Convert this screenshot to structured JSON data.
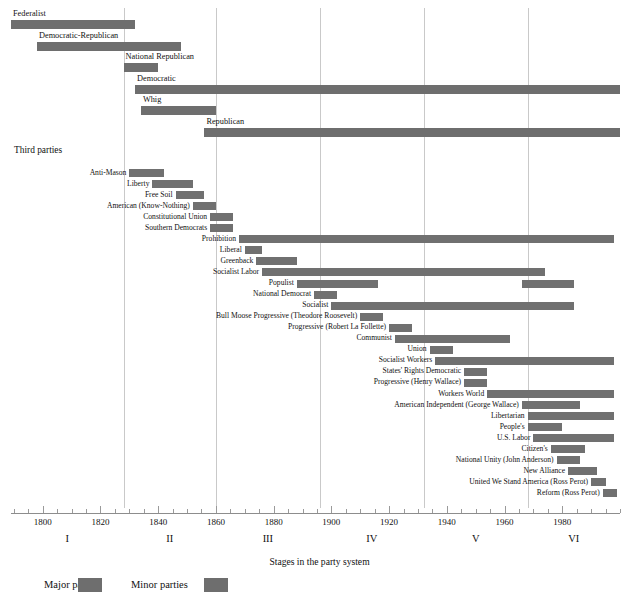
{
  "chart_data": {
    "type": "bar",
    "title": "",
    "subtitle": "",
    "xlabel": "Stages in the party system",
    "ylabel": "",
    "xlim": [
      1789,
      2000
    ],
    "grid": true,
    "legend_position": "bottom-left",
    "orientation": "horizontal-timeline",
    "tick_labels": [
      "1800",
      "1820",
      "1840",
      "1860",
      "1880",
      "1900",
      "1920",
      "1940",
      "1960",
      "1980"
    ],
    "tick_values": [
      1800,
      1820,
      1840,
      1860,
      1880,
      1900,
      1920,
      1940,
      1960,
      1980
    ],
    "minor_tick_step": 5,
    "stage_boundaries": [
      1828,
      1860,
      1896,
      1932,
      1968
    ],
    "stages": [
      {
        "label": "I",
        "start": 1789,
        "end": 1828
      },
      {
        "label": "II",
        "start": 1828,
        "end": 1860
      },
      {
        "label": "III",
        "start": 1860,
        "end": 1896
      },
      {
        "label": "IV",
        "start": 1896,
        "end": 1932
      },
      {
        "label": "V",
        "start": 1932,
        "end": 1968
      },
      {
        "label": "VI",
        "start": 1968,
        "end": 2000
      }
    ],
    "section_heading": "Third parties",
    "major_parties": [
      {
        "name": "Federalist",
        "spans": [
          [
            1789,
            1832
          ]
        ]
      },
      {
        "name": "Democratic-Republican",
        "spans": [
          [
            1798,
            1848
          ]
        ]
      },
      {
        "name": "National Republican",
        "spans": [
          [
            1828,
            1840
          ]
        ]
      },
      {
        "name": "Democratic",
        "spans": [
          [
            1832,
            2000
          ]
        ]
      },
      {
        "name": "Whig",
        "spans": [
          [
            1834,
            1860
          ]
        ]
      },
      {
        "name": "Republican",
        "spans": [
          [
            1856,
            2000
          ]
        ]
      }
    ],
    "minor_parties": [
      {
        "name": "Anti-Mason",
        "spans": [
          [
            1830,
            1842
          ]
        ]
      },
      {
        "name": "Liberty",
        "spans": [
          [
            1838,
            1852
          ]
        ]
      },
      {
        "name": "Free Soil",
        "spans": [
          [
            1846,
            1856
          ]
        ]
      },
      {
        "name": "American (Know-Nothing)",
        "spans": [
          [
            1852,
            1860
          ]
        ]
      },
      {
        "name": "Constitutional Union",
        "spans": [
          [
            1858,
            1866
          ]
        ]
      },
      {
        "name": "Southern Democrats",
        "spans": [
          [
            1858,
            1866
          ]
        ]
      },
      {
        "name": "Prohibition",
        "spans": [
          [
            1868,
            1998
          ]
        ]
      },
      {
        "name": "Liberal",
        "spans": [
          [
            1870,
            1876
          ]
        ]
      },
      {
        "name": "Greenback",
        "spans": [
          [
            1874,
            1888
          ]
        ]
      },
      {
        "name": "Socialist Labor",
        "spans": [
          [
            1876,
            1974
          ]
        ]
      },
      {
        "name": "Populist",
        "spans": [
          [
            1888,
            1916
          ],
          [
            1966,
            1984
          ]
        ]
      },
      {
        "name": "National Democrat",
        "spans": [
          [
            1894,
            1902
          ]
        ]
      },
      {
        "name": "Socialist",
        "spans": [
          [
            1900,
            1982
          ],
          [
            1962,
            1984
          ]
        ]
      },
      {
        "name": "Bull Moose Progressive (Theodore Roosevelt)",
        "spans": [
          [
            1910,
            1918
          ]
        ]
      },
      {
        "name": "Progressive (Robert La Follette)",
        "spans": [
          [
            1920,
            1928
          ]
        ]
      },
      {
        "name": "Communist",
        "spans": [
          [
            1922,
            1962
          ]
        ]
      },
      {
        "name": "Union",
        "spans": [
          [
            1934,
            1942
          ]
        ]
      },
      {
        "name": "Socialist Workers",
        "spans": [
          [
            1936,
            1998
          ]
        ]
      },
      {
        "name": "States' Rights Democratic",
        "spans": [
          [
            1946,
            1954
          ]
        ]
      },
      {
        "name": "Progressive (Henry Wallace)",
        "spans": [
          [
            1946,
            1954
          ]
        ]
      },
      {
        "name": "Workers World",
        "spans": [
          [
            1954,
            1998
          ]
        ]
      },
      {
        "name": "American Independent (George Wallace)",
        "spans": [
          [
            1966,
            1986
          ]
        ]
      },
      {
        "name": "Libertarian",
        "spans": [
          [
            1968,
            1998
          ]
        ]
      },
      {
        "name": "People's",
        "spans": [
          [
            1968,
            1980
          ]
        ]
      },
      {
        "name": "U.S. Labor",
        "spans": [
          [
            1970,
            1998
          ]
        ]
      },
      {
        "name": "Citizen's",
        "spans": [
          [
            1976,
            1988
          ]
        ]
      },
      {
        "name": "National Unity (John Anderson)",
        "spans": [
          [
            1978,
            1986
          ]
        ]
      },
      {
        "name": "New Alliance",
        "spans": [
          [
            1982,
            1992
          ]
        ]
      },
      {
        "name": "United We Stand America (Ross Perot)",
        "spans": [
          [
            1990,
            1995
          ]
        ]
      },
      {
        "name": "Reform (Ross Perot)",
        "spans": [
          [
            1994,
            1999
          ]
        ]
      }
    ],
    "legend": [
      {
        "label": "Major parties",
        "color": "#6e6e6e"
      },
      {
        "label": "Minor parties",
        "color": "#6e6e6e"
      }
    ]
  },
  "colors": {
    "bar": "#6e6e6e",
    "gridline": "#c9c9c9",
    "axis": "#8d8d8d",
    "text": "#111111",
    "background": "#ffffff"
  }
}
